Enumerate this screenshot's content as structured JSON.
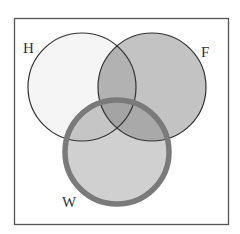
{
  "diagram": {
    "type": "venn",
    "sets": [
      {
        "id": "H",
        "label": "H",
        "fill": "#f5f5f5",
        "stroke": "#333333",
        "highlighted": false
      },
      {
        "id": "F",
        "label": "F",
        "fill": "#c3c3c3",
        "stroke": "#333333",
        "highlighted": false
      },
      {
        "id": "W",
        "label": "W",
        "fill": "#d0d0d0",
        "stroke": "#7a7a7a",
        "highlighted": true
      }
    ],
    "regions": {
      "H_and_F": "#b2b2b2",
      "H_and_W": "#c5c5c5",
      "F_and_W": "#a9a9a9",
      "H_and_F_and_W": "#a4a4a4"
    },
    "frame": {
      "stroke": "#555555"
    }
  }
}
